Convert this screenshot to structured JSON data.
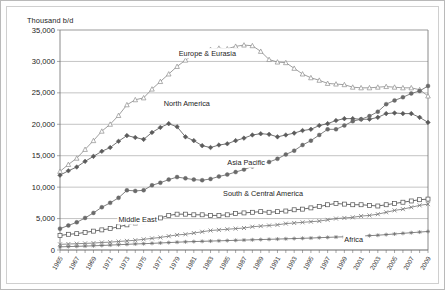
{
  "figure": {
    "y_axis_title": "Thousand b/d",
    "name": "oil-consumption-by-region-chart"
  },
  "chart_data": {
    "type": "line",
    "title": "",
    "subtitle": "",
    "xlabel": "",
    "ylabel": "Thousand b/d",
    "ylim": [
      0,
      35000
    ],
    "xlim": [
      1965,
      2009
    ],
    "grid": true,
    "legend_position": "inline-labels",
    "y_ticks": [
      0,
      5000,
      10000,
      15000,
      20000,
      25000,
      30000,
      35000
    ],
    "y_tick_labels": [
      "0",
      "5,000",
      "10,000",
      "15,000",
      "20,000",
      "25,000",
      "30,000",
      "35,000"
    ],
    "x": [
      1965,
      1966,
      1967,
      1968,
      1969,
      1970,
      1971,
      1972,
      1973,
      1974,
      1975,
      1976,
      1977,
      1978,
      1979,
      1980,
      1981,
      1982,
      1983,
      1984,
      1985,
      1986,
      1987,
      1988,
      1989,
      1990,
      1991,
      1992,
      1993,
      1994,
      1995,
      1996,
      1997,
      1998,
      1999,
      2000,
      2001,
      2002,
      2003,
      2004,
      2005,
      2006,
      2007,
      2008,
      2009
    ],
    "x_tick_labels": [
      "1965",
      "1967",
      "1969",
      "1971",
      "1973",
      "1975",
      "1977",
      "1979",
      "1981",
      "1983",
      "1985",
      "1987",
      "1989",
      "1991",
      "1993",
      "1995",
      "1997",
      "1999",
      "2001",
      "2003",
      "2005",
      "2007",
      "2009"
    ],
    "series": [
      {
        "name": "Europe & Eurasia",
        "marker": "open-triangle",
        "color": "#8e8e8e",
        "label_x": 1979.2,
        "label_y": 30900,
        "values": [
          12500,
          13600,
          14600,
          16000,
          17400,
          18900,
          20000,
          21400,
          23100,
          23900,
          24200,
          25600,
          26800,
          28000,
          29200,
          30200,
          31100,
          31600,
          31900,
          32100,
          32000,
          32400,
          32600,
          32500,
          31600,
          30300,
          29900,
          29800,
          28900,
          28000,
          27400,
          27000,
          26500,
          26400,
          26300,
          25900,
          25800,
          25800,
          25900,
          26000,
          25900,
          25800,
          25800,
          25500,
          24500
        ]
      },
      {
        "name": "North America",
        "marker": "filled-diamond",
        "color": "#5b5b5b",
        "label_x": 1977.4,
        "label_y": 22900,
        "values": [
          11900,
          12600,
          13200,
          14100,
          14900,
          15700,
          16300,
          17300,
          18200,
          17900,
          17600,
          18700,
          19500,
          20100,
          19600,
          18000,
          17400,
          16600,
          16300,
          16700,
          16900,
          17400,
          17800,
          18300,
          18500,
          18400,
          18000,
          18300,
          18600,
          19000,
          19200,
          19800,
          20100,
          20600,
          20900,
          20900,
          20800,
          20800,
          21100,
          21700,
          21800,
          21700,
          21700,
          21100,
          20300
        ]
      },
      {
        "name": "Asia Pacific",
        "marker": "filled-circle",
        "color": "#6a6a6a",
        "label_x": 1985.0,
        "label_y": 13500,
        "values": [
          3400,
          3900,
          4400,
          5100,
          5900,
          6800,
          7500,
          8300,
          9500,
          9400,
          9500,
          10300,
          10700,
          11200,
          11600,
          11400,
          11200,
          11100,
          11300,
          11700,
          12000,
          12400,
          12800,
          13300,
          13700,
          14000,
          14500,
          15200,
          15800,
          16700,
          17400,
          18300,
          19200,
          19200,
          19800,
          20500,
          20800,
          21300,
          22000,
          23200,
          23800,
          24300,
          24900,
          25300,
          26100
        ]
      },
      {
        "name": "South & Central America",
        "marker": "open-square",
        "color": "#4f4f4f",
        "label_x": 1984.5,
        "label_y": 8600,
        "values": [
          2300,
          2500,
          2600,
          2800,
          3000,
          3200,
          3400,
          3700,
          4000,
          4300,
          4500,
          4800,
          5100,
          5500,
          5700,
          5700,
          5600,
          5600,
          5500,
          5500,
          5600,
          5800,
          5900,
          6000,
          6100,
          6000,
          6100,
          6200,
          6400,
          6500,
          6700,
          6900,
          7200,
          7400,
          7300,
          7200,
          7200,
          7100,
          7000,
          7200,
          7400,
          7600,
          7800,
          8000,
          8100
        ]
      },
      {
        "name": "Middle East",
        "marker": "cross",
        "color": "#7a7a7a",
        "label_x": 1972.0,
        "label_y": 4450,
        "values": [
          900,
          950,
          1000,
          1050,
          1100,
          1200,
          1250,
          1350,
          1450,
          1550,
          1700,
          1850,
          2000,
          2200,
          2400,
          2500,
          2700,
          2900,
          3100,
          3200,
          3300,
          3400,
          3500,
          3700,
          3800,
          3900,
          4000,
          4200,
          4300,
          4400,
          4500,
          4600,
          4800,
          5000,
          5100,
          5200,
          5400,
          5500,
          5700,
          6000,
          6300,
          6500,
          6800,
          7100,
          7300
        ]
      },
      {
        "name": "Africa",
        "marker": "asterisk",
        "color": "#6f6f6f",
        "label_x": 1999.0,
        "label_y": 1350,
        "values": [
          500,
          540,
          580,
          620,
          670,
          720,
          780,
          840,
          900,
          960,
          1000,
          1060,
          1120,
          1180,
          1240,
          1300,
          1340,
          1380,
          1420,
          1460,
          1500,
          1540,
          1580,
          1620,
          1660,
          1700,
          1740,
          1780,
          1820,
          1860,
          1900,
          1960,
          2010,
          2060,
          2100,
          2160,
          2220,
          2280,
          2350,
          2450,
          2550,
          2650,
          2750,
          2850,
          2950
        ]
      }
    ]
  }
}
